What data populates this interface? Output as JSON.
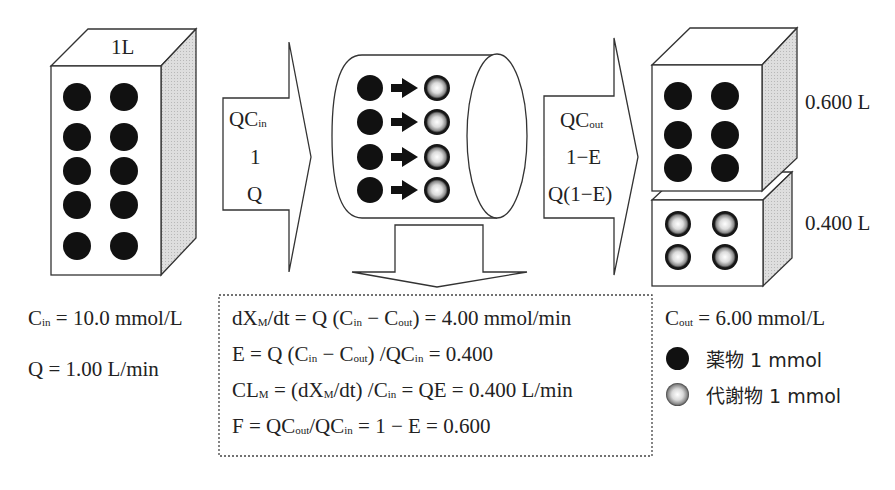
{
  "inlet_box": {
    "volume_label": "1L",
    "drug_count": 10
  },
  "inflow_arrow": {
    "lines": [
      "QC",
      "1",
      "Q"
    ],
    "line1_sub": "in"
  },
  "organ": {
    "conversions": 4
  },
  "outflow_arrow": {
    "lines": [
      "QC",
      "1−E",
      "Q(1−E)"
    ],
    "line1_sub": "out"
  },
  "outlet_upper_box": {
    "volume_label": "0.600 L",
    "drug_count": 6
  },
  "outlet_lower_box": {
    "volume_label": "0.400 L",
    "metabolite_count": 4
  },
  "inlet_params": {
    "cin_symbol": "C",
    "cin_sub": "in",
    "cin_value": " = 10.0 mmol/L",
    "q_text": "Q = 1.00 L/min"
  },
  "equations": {
    "line1": {
      "a": "dX",
      "a_sub": "M",
      "b": "/dt = Q (C",
      "b_sub": "in",
      "c": " − C",
      "c_sub": "out",
      "d": ") = 4.00 mmol/min"
    },
    "line2": {
      "a": "E = Q (C",
      "a_sub": "in",
      "b": " − C",
      "b_sub": "out",
      "c": ") /QC",
      "c_sub": "in",
      "d": " = 0.400"
    },
    "line3": {
      "a": "CL",
      "a_sub": "M",
      "b": " = (dX",
      "b_sub": "M",
      "c": "/dt) /C",
      "c_sub": "in",
      "d": " = QE = 0.400 L/min"
    },
    "line4": {
      "a": "F = QC",
      "a_sub": "out",
      "b": "/QC",
      "b_sub": "in",
      "c": " = 1 − E = 0.600"
    }
  },
  "outlet_params": {
    "cout_symbol": "C",
    "cout_sub": "out",
    "cout_value": " = 6.00 mmol/L"
  },
  "legend": [
    {
      "icon": "drug-dot",
      "label": "薬物  1 mmol"
    },
    {
      "icon": "metabolite-dot",
      "label": "代謝物 1 mmol"
    }
  ],
  "colors": {
    "line": "#333333",
    "side_shade": "#d6d6d6",
    "dot": "#111111"
  }
}
